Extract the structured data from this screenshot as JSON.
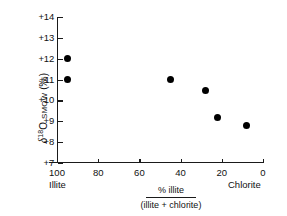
{
  "chart_data": {
    "type": "scatter",
    "title": "",
    "xlabel": "% illite / (illite + chlorite)",
    "xlabel_numerator": "% illite",
    "xlabel_denominator": "(illite + chlorite)",
    "ylabel": "δ¹⁸O SMOW (‰)",
    "ylabel_parts": {
      "delta": "δ",
      "superscript": "18",
      "element": "O",
      "standard": "SMOW",
      "units": "(‰)"
    },
    "xlim": [
      100,
      0
    ],
    "ylim": [
      7,
      14
    ],
    "x_reversed": true,
    "grid": false,
    "legend": null,
    "xticks": [
      100,
      80,
      60,
      40,
      20,
      0
    ],
    "xtick_labels": [
      "100",
      "80",
      "60",
      "40",
      "20",
      "0"
    ],
    "yticks": [
      7,
      8,
      9,
      10,
      11,
      12,
      13,
      14
    ],
    "ytick_labels": [
      "+7",
      "+8",
      "+9",
      "+10",
      "+11",
      "+12",
      "+13",
      "+14"
    ],
    "x_axis_end_labels": {
      "left": "Illite",
      "right": "Chlorite"
    },
    "marker": {
      "shape": "circle",
      "filled": true,
      "color": "#000000",
      "size": 7
    },
    "axis_color": "#1a1a1a",
    "background_color": "#ffffff",
    "points": [
      {
        "x": 95,
        "y": 12.0
      },
      {
        "x": 95,
        "y": 11.0
      },
      {
        "x": 45,
        "y": 11.0
      },
      {
        "x": 28,
        "y": 10.5
      },
      {
        "x": 22,
        "y": 9.2
      },
      {
        "x": 8,
        "y": 8.8
      }
    ]
  }
}
